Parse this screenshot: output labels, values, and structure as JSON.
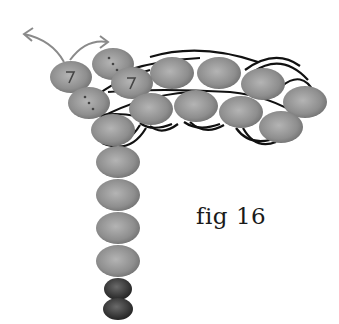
{
  "figure": {
    "caption": "fig 16",
    "colors": {
      "bead_light": "#b4b4b4",
      "bead_mid": "#8c8c8c",
      "bead_dark": "#6a6a6a",
      "end_bead_light": "#6a6a6a",
      "end_bead_dark": "#1e1e1e",
      "thread": "#111111",
      "arrow": "#8a8a8a",
      "marker": "#444444"
    },
    "beads_back_row": [
      {
        "cx": 172,
        "cy": 73,
        "rx": 22,
        "ry": 16
      },
      {
        "cx": 219,
        "cy": 73,
        "rx": 22,
        "ry": 16
      },
      {
        "cx": 263,
        "cy": 84,
        "rx": 22,
        "ry": 16
      },
      {
        "cx": 305,
        "cy": 102,
        "rx": 22,
        "ry": 16
      }
    ],
    "beads_front_row": [
      {
        "cx": 151,
        "cy": 109,
        "rx": 22,
        "ry": 16
      },
      {
        "cx": 196,
        "cy": 106,
        "rx": 22,
        "ry": 16
      },
      {
        "cx": 241,
        "cy": 112,
        "rx": 22,
        "ry": 16
      },
      {
        "cx": 281,
        "cy": 127,
        "rx": 22,
        "ry": 16
      }
    ],
    "beads_turn": [
      {
        "cx": 113,
        "cy": 64,
        "rx": 21,
        "ry": 16,
        "marker": "dots"
      },
      {
        "cx": 71,
        "cy": 77,
        "rx": 21,
        "ry": 16,
        "marker": "chevron"
      },
      {
        "cx": 132,
        "cy": 83,
        "rx": 21,
        "ry": 16,
        "marker": "chevron"
      },
      {
        "cx": 89,
        "cy": 103,
        "rx": 21,
        "ry": 16,
        "marker": "dots"
      }
    ],
    "beads_stem": [
      {
        "cx": 113,
        "cy": 130,
        "rx": 22,
        "ry": 16
      },
      {
        "cx": 118,
        "cy": 162,
        "rx": 22,
        "ry": 16
      },
      {
        "cx": 118,
        "cy": 195,
        "rx": 22,
        "ry": 16
      },
      {
        "cx": 118,
        "cy": 228,
        "rx": 22,
        "ry": 16
      },
      {
        "cx": 118,
        "cy": 261,
        "rx": 22,
        "ry": 16
      }
    ],
    "end_beads": [
      {
        "cx": 118,
        "cy": 289,
        "rx": 14,
        "ry": 11
      },
      {
        "cx": 118,
        "cy": 309,
        "rx": 15,
        "ry": 11
      }
    ],
    "arrows": [
      {
        "name": "exit-arrow-left",
        "path": "M 64 62 Q 52 40 24 34",
        "head": "24,34"
      },
      {
        "name": "exit-arrow-top",
        "path": "M 70 60 Q 86 38 108 42",
        "head": "108,42"
      }
    ]
  }
}
